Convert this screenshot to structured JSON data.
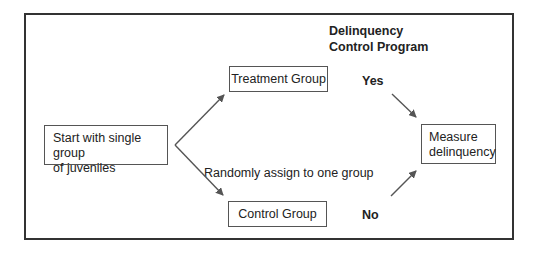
{
  "diagram": {
    "title_lines": [
      "Delinquency",
      "Control Program"
    ],
    "nodes": {
      "start": {
        "lines": [
          "Start with single group",
          "of juveniles"
        ]
      },
      "treatment": {
        "label": "Treatment Group"
      },
      "control": {
        "label": "Control Group"
      },
      "measure": {
        "lines": [
          "Measure",
          "delinquency"
        ]
      }
    },
    "edge_labels": {
      "assign": "Randomly assign to one group",
      "yes": "Yes",
      "no": "No"
    },
    "colors": {
      "frame": "#333333",
      "box_border": "#555555",
      "arrow": "#555555",
      "text": "#222222"
    }
  }
}
